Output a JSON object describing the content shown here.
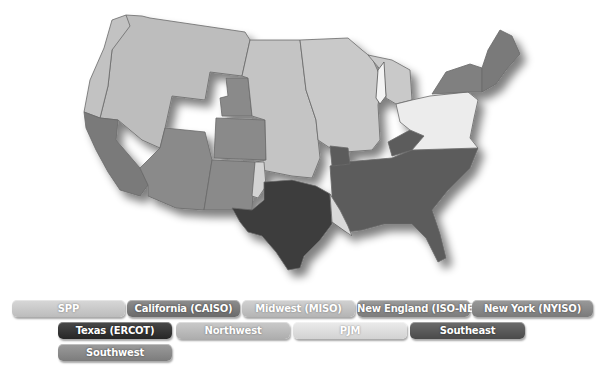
{
  "map": {
    "title": "U.S. Electricity Markets",
    "colors": {
      "spp": "#c4c4c4",
      "caiso": "#7c7c7c",
      "miso": "#c9c9c9",
      "isone": "#7a7a7a",
      "nyiso": "#808080",
      "ercot": "#3c3c3c",
      "northwest": "#bdbdbd",
      "pjm": "#e8e8e8",
      "southeast": "#5c5c5c",
      "southwest": "#8a8a8a",
      "border": "#6a6a6a"
    }
  },
  "legend": {
    "items": [
      {
        "key": "spp",
        "label": "SPP",
        "color": "#c9c9c9"
      },
      {
        "key": "caiso",
        "label": "California (CAISO)",
        "color": "#7a7a7a"
      },
      {
        "key": "miso",
        "label": "Midwest (MISO)",
        "color": "#c2c2c2"
      },
      {
        "key": "isone",
        "label": "New England (ISO-NE)",
        "color": "#8a8a8a"
      },
      {
        "key": "nyiso",
        "label": "New York (NYISO)",
        "color": "#888888"
      },
      {
        "key": "ercot",
        "label": "Texas (ERCOT)",
        "color": "#363636"
      },
      {
        "key": "northwest",
        "label": "Northwest",
        "color": "#bcbcbc"
      },
      {
        "key": "pjm",
        "label": "PJM",
        "color": "#e0e0e0"
      },
      {
        "key": "southeast",
        "label": "Southeast",
        "color": "#5a5a5a"
      },
      {
        "key": "southwest",
        "label": "Southwest",
        "color": "#8c8c8c"
      }
    ]
  }
}
